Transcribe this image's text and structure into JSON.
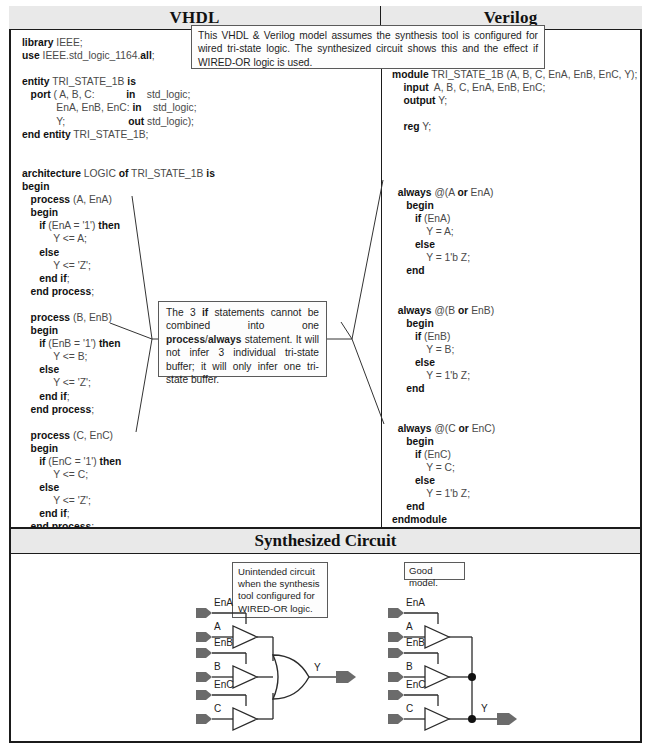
{
  "table": {
    "headers": {
      "vhdl": "VHDL",
      "verilog": "Verilog"
    },
    "synthesized_section_title": "Synthesized Circuit"
  },
  "notes": {
    "top": {
      "segments": [
        "This VHDL & Verilog model assumes the synthesis tool is configured for wired tri-state logic. The synthesized circuit shows this and the effect if WIRED-OR logic is used."
      ],
      "text": "This VHDL & Verilog model assumes the synthesis tool is configured for wired tri-state logic. The synthesized circuit shows this and the effect if WIRED-OR logic is used."
    },
    "middle": {
      "part1": "The 3 ",
      "bold1": "if",
      "part2": " statements cannot be combined into one ",
      "bold2": "process",
      "part3": "/",
      "bold3": "always",
      "part4": " statement. It will not infer 3 individual tri-state buffer; it will only infer one tri-state buffer."
    },
    "unintended": "Unintended circuit when the synthesis tool configured for WIRED-OR logic.",
    "good_model": "Good model."
  },
  "vhdl_code": {
    "lines": [
      {
        "b": "library",
        "n": " IEEE;"
      },
      {
        "b": "use",
        "n": " IEEE.std_logic_1164.",
        "b2": "all",
        "n2": ";"
      },
      {
        "n": ""
      },
      {
        "b": "entity",
        "n": " TRI_STATE_1B ",
        "b2": "is",
        "n2": ""
      },
      {
        "n": "   ",
        "b": "port",
        "n2": " ( A, B, C:           in    std_logic;"
      },
      {
        "n": "            EnA, EnB, EnC: ",
        "b": "in",
        "n2": "    std_logic;"
      },
      {
        "n": "            Y;                      ",
        "b": "out",
        "n2": " std_logic);"
      },
      {
        "b": "end entity",
        "n": " TRI_STATE_1B;"
      },
      {
        "n": ""
      },
      {
        "n": ""
      },
      {
        "b": "architecture",
        "n": " LOGIC ",
        "b2": "of",
        "n2": " TRI_STATE_1B ",
        "b3": "is"
      },
      {
        "b": "begin"
      },
      {
        "n": "   ",
        "b": "process",
        "n2": " (A, EnA)"
      },
      {
        "n": "   ",
        "b": "begin"
      },
      {
        "n": "      ",
        "b": "if",
        "n2": " (EnA = '1') ",
        "b3": "then"
      },
      {
        "n": "           Y <= A;"
      },
      {
        "n": "      ",
        "b": "else"
      },
      {
        "n": "           Y <= 'Z';"
      },
      {
        "n": "      ",
        "b": "end if",
        "n2": ";"
      },
      {
        "n": "   ",
        "b": "end process",
        "n2": ";"
      },
      {
        "n": ""
      },
      {
        "n": "   ",
        "b": "process",
        "n2": " (B, EnB)"
      },
      {
        "n": "   ",
        "b": "begin"
      },
      {
        "n": "      ",
        "b": "if",
        "n2": " (EnB = '1') ",
        "b3": "then"
      },
      {
        "n": "           Y <= B;"
      },
      {
        "n": "      ",
        "b": "else"
      },
      {
        "n": "           Y <= 'Z';"
      },
      {
        "n": "      ",
        "b": "end if",
        "n2": ";"
      },
      {
        "n": "   ",
        "b": "end process",
        "n2": ";"
      },
      {
        "n": ""
      },
      {
        "n": "   ",
        "b": "process",
        "n2": " (C, EnC)"
      },
      {
        "n": "   ",
        "b": "begin"
      },
      {
        "n": "      ",
        "b": "if",
        "n2": " (EnC = '1') ",
        "b3": "then"
      },
      {
        "n": "           Y <= C;"
      },
      {
        "n": "      ",
        "b": "else"
      },
      {
        "n": "           Y <= 'Z';"
      },
      {
        "n": "      ",
        "b": "end if",
        "n2": ";"
      },
      {
        "n": "   ",
        "b": "end process",
        "n2": ";"
      },
      {
        "b": "end architecture",
        "n": " LOGIC;"
      }
    ],
    "plain": "library IEEE;\nuse IEEE.std_logic_1164.all;\n\nentity TRI_STATE_1B is\n   port ( A, B, C:           in    std_logic;\n            EnA, EnB, EnC: in    std_logic;\n            Y;                      out std_logic);\nend entity TRI_STATE_1B;\n\n\narchitecture LOGIC of TRI_STATE_1B is\nbegin\n   process (A, EnA)\n   begin\n      if (EnA = '1') then\n           Y <= A;\n      else\n           Y <= 'Z';\n      end if;\n   end process;\n\n   process (B, EnB)\n   begin\n      if (EnB = '1') then\n           Y <= B;\n      else\n           Y <= 'Z';\n      end if;\n   end process;\n\n   process (C, EnC)\n   begin\n      if (EnC = '1') then\n           Y <= C;\n      else\n           Y <= 'Z';\n      end if;\n   end process;\nend architecture LOGIC;"
  },
  "verilog_code": {
    "plain": "module TRI_STATE_1B (A, B, C, EnA, EnB, EnC, Y);\n    input  A, B, C, EnA, EnB, EnC;\n    output Y;\n\n    reg Y;\n\n\n\n\n  always @(A or EnA)\n     begin\n        if (EnA)\n            Y = A;\n        else\n            Y = 1'b Z;\n     end\n\n\n  always @(B or EnB)\n     begin\n        if (EnB)\n            Y = B;\n        else\n            Y = 1'b Z;\n     end\n\n\n  always @(C or EnC)\n     begin\n        if (EnC)\n            Y = C;\n        else\n            Y = 1'b Z;\n     end\nendmodule"
  },
  "circuits": {
    "left": {
      "caption": "Unintended circuit when the synthesis tool configured for WIRED-OR logic.",
      "inputs": [
        "EnA",
        "A",
        "EnB",
        "B",
        "EnC",
        "C"
      ],
      "output": "Y",
      "gate": "or-gate",
      "buffers": 3
    },
    "right": {
      "caption": "Good model.",
      "inputs": [
        "EnA",
        "A",
        "EnB",
        "B",
        "EnC",
        "C"
      ],
      "output": "Y",
      "gate": "wired-node",
      "buffers": 3
    }
  },
  "colors": {
    "header_band": "#e9e9e9",
    "border": "#1b1b1b",
    "code_keyword": "#111111",
    "code_plain": "#4a4a4a",
    "pin_arrow": "#6b6b6b"
  }
}
